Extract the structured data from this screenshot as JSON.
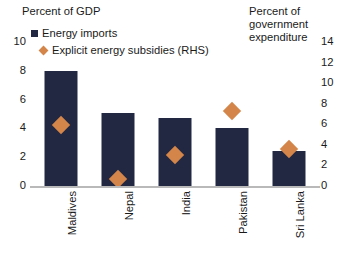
{
  "chart_data": {
    "type": "bar",
    "title": "",
    "categories": [
      "Maldives",
      "Nepal",
      "India",
      "Pakistan",
      "Sri Lanka"
    ],
    "series": [
      {
        "name": "Energy imports",
        "type": "bar",
        "axis": "left",
        "color": "#232842",
        "marker": "square",
        "values": [
          8.0,
          5.1,
          4.7,
          4.0,
          2.4
        ]
      },
      {
        "name": "Explicit energy subsidies (RHS)",
        "type": "scatter",
        "axis": "right",
        "color": "#d4864a",
        "marker": "diamond",
        "values": [
          5.9,
          0.7,
          3.0,
          7.3,
          3.6
        ]
      }
    ],
    "left_axis": {
      "label": "Percent of GDP",
      "ticks": [
        "0",
        "2",
        "4",
        "6",
        "8",
        "10"
      ],
      "tick_values": [
        0,
        2,
        4,
        6,
        8,
        10
      ],
      "ylim": [
        0,
        10
      ]
    },
    "right_axis": {
      "label": "Percent of\ngovernment\nexpenditure",
      "ticks": [
        "0",
        "2",
        "4",
        "6",
        "8",
        "10",
        "12",
        "14"
      ],
      "tick_values": [
        0,
        2,
        4,
        6,
        8,
        10,
        12,
        14
      ],
      "ylim": [
        0,
        14
      ]
    },
    "xlabel": "",
    "grid": false,
    "legend_position": "top-left"
  },
  "legend": {
    "imports_label": "Energy imports",
    "subsidies_label": "Explicit energy subsidies (RHS)"
  },
  "axis_titles": {
    "left": "Percent of GDP",
    "right": "Percent of\ngovernment\nexpenditure"
  }
}
